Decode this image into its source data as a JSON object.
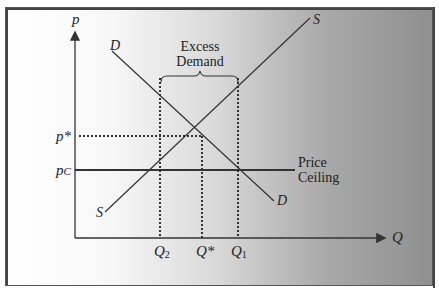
{
  "diagram": {
    "axes": {
      "y_label": "p",
      "x_label": "Q"
    },
    "curves": {
      "demand_label_top": "D",
      "demand_label_bottom": "D",
      "supply_label_top": "S",
      "supply_label_bottom": "S"
    },
    "price_levels": {
      "equilibrium": "p*",
      "ceiling_base": "p",
      "ceiling_sub": "C"
    },
    "quantities": {
      "q2_base": "Q",
      "q2_sub": "2",
      "qstar": "Q*",
      "q1_base": "Q",
      "q1_sub": "1"
    },
    "annotations": {
      "excess_line1": "Excess",
      "excess_line2": "Demand",
      "ceiling_line1": "Price",
      "ceiling_line2": "Ceiling"
    },
    "colors": {
      "line": "#333333",
      "border": "#555555"
    }
  }
}
